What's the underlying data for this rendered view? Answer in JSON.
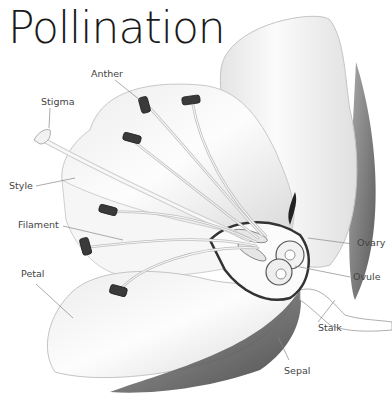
{
  "title": "Pollination",
  "labels": {
    "anther": "Anther",
    "stigma": "Stigma",
    "style": "Style",
    "filament": "Filament",
    "petal": "Petal",
    "ovary": "Ovary",
    "ovule": "Ovule",
    "stalk": "Stalk",
    "sepal": "Sepal"
  },
  "colors": {
    "text": "#444444",
    "title": "#1a1a1a",
    "leader_line": "#888888",
    "petal_fill": "#fafafa",
    "petal_edge": "#b0b0b0",
    "anther_fill": "#3a3a3a",
    "sepal_dark": "#4a4a4a"
  }
}
